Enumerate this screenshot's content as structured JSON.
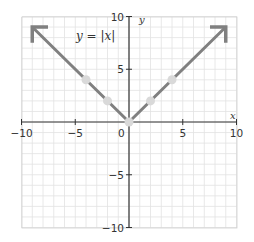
{
  "chart_data": {
    "type": "line",
    "title": "",
    "annotation": "y = |x|",
    "equation_parts": {
      "y": "y",
      "eq": " = |",
      "x": "x",
      "close": "|"
    },
    "xlabel": "x",
    "ylabel": "y",
    "xlim": [
      -10,
      10
    ],
    "ylim": [
      -10,
      10
    ],
    "grid": true,
    "grid_step": 1,
    "x_ticks": [
      -10,
      -5,
      5,
      10
    ],
    "y_ticks": [
      10,
      5,
      -5,
      -10
    ],
    "x_tick_labels": [
      "−10",
      "−5",
      "5",
      "10"
    ],
    "y_tick_labels": [
      "10",
      "5",
      "−5",
      "−10"
    ],
    "origin_label": "0",
    "series": [
      {
        "name": "y = |x|",
        "x": [
          -9,
          0,
          9
        ],
        "y": [
          9,
          0,
          9
        ],
        "color": "#808080",
        "arrows": "both-ends"
      }
    ],
    "highlighted_points": [
      {
        "x": -4,
        "y": 4
      },
      {
        "x": -2,
        "y": 2
      },
      {
        "x": 0,
        "y": 0
      },
      {
        "x": 2,
        "y": 2
      },
      {
        "x": 4,
        "y": 4
      }
    ],
    "colors": {
      "line": "#808080",
      "point": "#d9d9d9",
      "grid": "#e2e2e2",
      "axis": "#333333"
    }
  }
}
